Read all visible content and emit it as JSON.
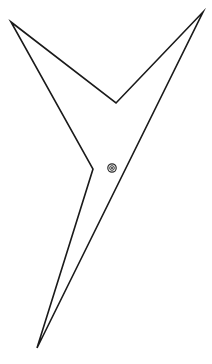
{
  "figure": {
    "background_color": "#ffffff",
    "width": 212,
    "height": 364,
    "shape": {
      "name": "dart-polygon",
      "type": "closed-polygon",
      "stroke_color": "#1a1a1a",
      "stroke_width": 1.6,
      "fill": "none",
      "vertex_count": 6,
      "vertices": [
        {
          "label": "top-left-tip",
          "x": 11,
          "y": 22
        },
        {
          "label": "v-notch-apex",
          "x": 116,
          "y": 103
        },
        {
          "label": "top-right-tip",
          "x": 203,
          "y": 12
        },
        {
          "label": "bottom-tip",
          "x": 37,
          "y": 348
        },
        {
          "label": "lower-left-notch",
          "x": 93,
          "y": 169
        },
        {
          "label": "upper-left-return",
          "x": 11,
          "y": 22
        }
      ],
      "path": "M 11,22 L 116,103 L 203,12 L 37,348 L 93,169 Z"
    },
    "marker": {
      "name": "centroid-marker",
      "symbol": "bullseye-icon",
      "x": 112,
      "y": 168,
      "outer_radius": 4.2,
      "inner_radius": 2.3,
      "core_radius": 1.0,
      "color": "#2b2b2b"
    }
  },
  "chart_data": {
    "type": "scatter",
    "xlabel": "",
    "ylabel": "",
    "xlim": [
      0,
      212
    ],
    "ylim": [
      0,
      364
    ],
    "grid": false,
    "legend": "none",
    "series": [
      {
        "name": "polygon-outline",
        "kind": "closed-polyline",
        "x": [
          11,
          116,
          203,
          37,
          93,
          11
        ],
        "y": [
          22,
          103,
          12,
          348,
          169,
          22
        ]
      },
      {
        "name": "centroid-marker",
        "kind": "point",
        "x": [
          112
        ],
        "y": [
          168
        ]
      }
    ]
  }
}
